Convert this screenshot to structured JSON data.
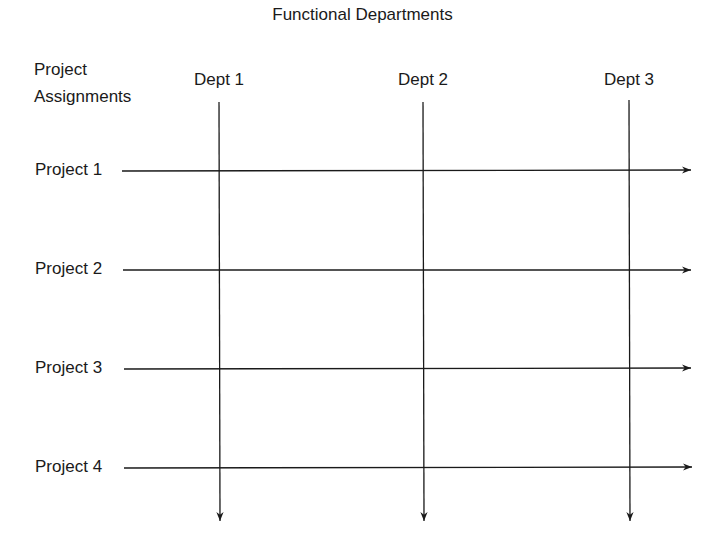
{
  "title": "Functional Departments",
  "row_header": {
    "line1": "Project",
    "line2": "Assignments"
  },
  "departments": [
    {
      "label": "Dept 1",
      "x": 219
    },
    {
      "label": "Dept 2",
      "x": 423
    },
    {
      "label": "Dept 3",
      "x": 629
    }
  ],
  "projects": [
    {
      "label": "Project 1",
      "y": 171
    },
    {
      "label": "Project 2",
      "y": 270
    },
    {
      "label": "Project 3",
      "y": 369
    },
    {
      "label": "Project 4",
      "y": 468
    }
  ],
  "geometry": {
    "vertical_start_y": 102,
    "vertical_end_y": 521,
    "horizontal_start_x": 122,
    "horizontal_end_x": 691
  },
  "colors": {
    "line": "#1a1a1a",
    "text": "#1a1a1a",
    "background": "#ffffff"
  }
}
